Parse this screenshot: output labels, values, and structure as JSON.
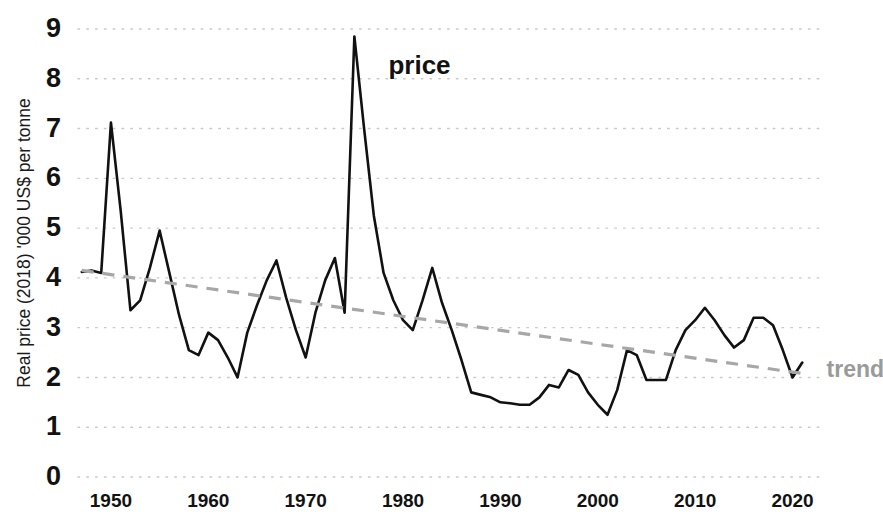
{
  "chart_data": {
    "type": "line",
    "title": "",
    "xlabel": "",
    "ylabel": "Real price (2018) '000 US$ per tonne",
    "xlim": [
      1946,
      2022
    ],
    "ylim": [
      0,
      9
    ],
    "grid": true,
    "grid_axis": "y",
    "legend_position": "inline-annotations",
    "y_ticks": [
      0,
      1,
      2,
      3,
      4,
      5,
      6,
      7,
      8,
      9
    ],
    "y_tick_labels": [
      "0",
      "1",
      "2",
      "3",
      "4",
      "5",
      "6",
      "7",
      "8",
      "9"
    ],
    "x_ticks": [
      1950,
      1960,
      1970,
      1980,
      1990,
      2000,
      2010,
      2020
    ],
    "x_tick_labels": [
      "1950",
      "1960",
      "1970",
      "1980",
      "1990",
      "2000",
      "2010",
      "2020"
    ],
    "annotations": [
      {
        "name": "price",
        "text": "price",
        "x": 1978.5,
        "y": 8.1,
        "color": "#111111"
      },
      {
        "name": "trend",
        "text": "trend",
        "x": 2023.5,
        "y": 2.0,
        "color": "#9a9a9a"
      }
    ],
    "series": [
      {
        "name": "price",
        "label": "price",
        "color": "#111111",
        "style": "solid",
        "x": [
          1947,
          1948,
          1949,
          1950,
          1951,
          1952,
          1953,
          1954,
          1955,
          1956,
          1957,
          1958,
          1959,
          1960,
          1961,
          1962,
          1963,
          1964,
          1965,
          1966,
          1967,
          1968,
          1969,
          1970,
          1971,
          1972,
          1973,
          1974,
          1975,
          1976,
          1977,
          1978,
          1979,
          1980,
          1981,
          1982,
          1983,
          1984,
          1985,
          1986,
          1987,
          1988,
          1989,
          1990,
          1991,
          1992,
          1993,
          1994,
          1995,
          1996,
          1997,
          1998,
          1999,
          2000,
          2001,
          2002,
          2003,
          2004,
          2005,
          2006,
          2007,
          2008,
          2009,
          2010,
          2011,
          2012,
          2013,
          2014,
          2015,
          2016,
          2017,
          2018,
          2019,
          2020,
          2021
        ],
        "y": [
          4.12,
          4.15,
          4.1,
          7.12,
          5.35,
          3.35,
          3.55,
          4.2,
          4.95,
          4.1,
          3.25,
          2.55,
          2.45,
          2.9,
          2.75,
          2.4,
          2.0,
          2.9,
          3.45,
          3.95,
          4.35,
          3.6,
          2.95,
          2.4,
          3.3,
          3.95,
          4.4,
          3.3,
          8.85,
          7.0,
          5.25,
          4.1,
          3.55,
          3.15,
          2.95,
          3.55,
          4.2,
          3.5,
          2.95,
          2.35,
          1.7,
          1.65,
          1.6,
          1.5,
          1.48,
          1.45,
          1.45,
          1.6,
          1.85,
          1.8,
          2.15,
          2.05,
          1.7,
          1.45,
          1.25,
          1.75,
          2.55,
          2.45,
          1.95,
          1.95,
          1.95,
          2.55,
          2.95,
          3.15,
          3.4,
          3.15,
          2.85,
          2.6,
          2.75,
          3.2,
          3.2,
          3.05,
          2.55,
          2.0,
          2.3
        ]
      },
      {
        "name": "trend",
        "label": "trend",
        "color": "#a7a7a7",
        "style": "dashed",
        "x": [
          1947,
          2021
        ],
        "y": [
          4.15,
          2.08
        ]
      }
    ]
  }
}
